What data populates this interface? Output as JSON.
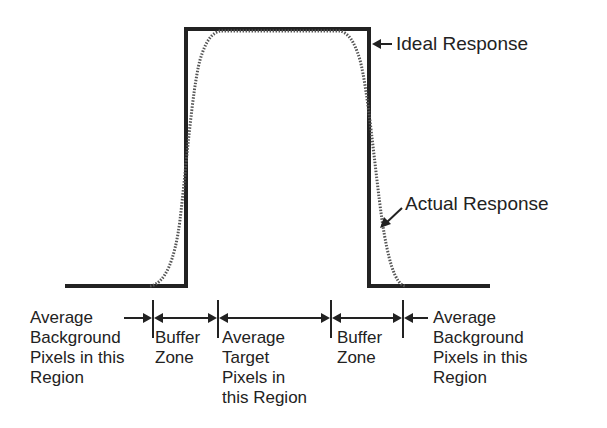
{
  "diagram": {
    "ideal_label": "Ideal Response",
    "actual_label": "Actual Response",
    "regions": [
      {
        "id": "left-background",
        "text": "Average\nBackground\nPixels in this\nRegion"
      },
      {
        "id": "left-buffer",
        "text": "Buffer\nZone"
      },
      {
        "id": "target",
        "text": "Average\nTarget\nPixels in\nthis Region"
      },
      {
        "id": "right-buffer",
        "text": "Buffer\nZone"
      },
      {
        "id": "right-background",
        "text": "Average\nBackground\nPixels in this\nRegion"
      }
    ],
    "colors": {
      "line": "#222222",
      "curve": "#555555",
      "background": "#ffffff"
    }
  }
}
